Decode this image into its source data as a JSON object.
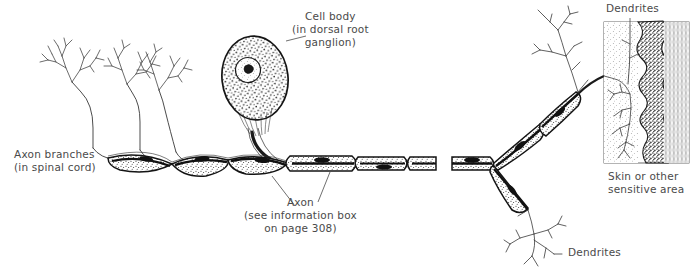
{
  "figure": {
    "type": "anatomical-line-drawing",
    "width": 691,
    "height": 279,
    "background_color": "#ffffff",
    "ink_color": "#1a1a1a",
    "text_color": "#4a4a4a"
  },
  "labels": {
    "cell_body": "Cell body\n(in dorsal root\nganglion)",
    "axon_branches": "Axon branches\n(in spinal cord)",
    "axon": "Axon\n(see information box\non page 308)",
    "dendrites_top": "Dendrites",
    "skin": "Skin or other\nsensitive area",
    "dendrites_bottom": "Dendrites"
  },
  "structures": {
    "cell_body": {
      "name": "Cell body",
      "shape": "stippled oval soma",
      "has_nucleus": true,
      "has_nucleolus": true
    },
    "axon": {
      "name": "Axon",
      "myelinated": true,
      "segments": "myelin sheath segments separated by nodes of Ranvier",
      "has_schwann_nuclei": true
    },
    "axon_branches": {
      "name": "Axon branches",
      "location": "spinal cord",
      "count": 3
    },
    "dendrites": {
      "name": "Dendrites",
      "locations": [
        "skin",
        "below skin"
      ],
      "count": 2
    },
    "skin_block": {
      "name": "Skin or other sensitive area",
      "layers": [
        "stippled dermis",
        "dark wavy junction band",
        "striated epidermis"
      ]
    }
  }
}
